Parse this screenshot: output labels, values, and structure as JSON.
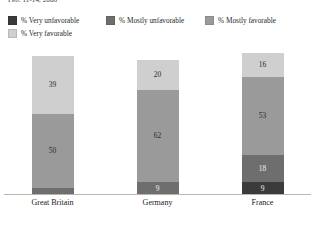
{
  "header": {
    "survey_date": "Feb. 11-14, 2008"
  },
  "legend": {
    "rows": [
      [
        {
          "label": "% Very unfavorable",
          "color": "#3b3b3b",
          "key": "very-unfavorable"
        },
        {
          "label": "% Mostly unfavorable",
          "color": "#6e6e6e",
          "key": "mostly-unfavorable"
        },
        {
          "label": "% Mostly favorable",
          "color": "#9a9a9a",
          "key": "mostly-favorable"
        }
      ],
      [
        {
          "label": "% Very favorable",
          "color": "#cfcfcf",
          "key": "very-favorable"
        }
      ]
    ]
  },
  "chart_data": {
    "type": "bar",
    "subtype": "stacked-bar",
    "title": "",
    "subtitle": "Feb. 11-14, 2008",
    "xlabel": "",
    "ylabel": "",
    "ylim": [
      0,
      100
    ],
    "grid": false,
    "legend_position": "top",
    "categories": [
      "Great Britain",
      "Germany",
      "France"
    ],
    "series": [
      {
        "name": "% Very unfavorable",
        "color": "#3b3b3b",
        "values": [
          0,
          0,
          9
        ],
        "labels": [
          "",
          "",
          "9"
        ]
      },
      {
        "name": "% Mostly unfavorable",
        "color": "#6e6e6e",
        "values": [
          5,
          9,
          18
        ],
        "labels": [
          "",
          "9",
          "18"
        ]
      },
      {
        "name": "% Mostly favorable",
        "color": "#9a9a9a",
        "values": [
          50,
          62,
          53
        ],
        "labels": [
          "50",
          "62",
          "53"
        ]
      },
      {
        "name": "% Very favorable",
        "color": "#cfcfcf",
        "values": [
          39,
          20,
          16
        ],
        "labels": [
          "39",
          "20",
          "16"
        ]
      }
    ]
  },
  "bars": [
    {
      "category": "Great Britain",
      "segments": [
        {
          "key": "very-favorable",
          "value": 39,
          "label": "39",
          "color": "#cfcfcf",
          "tone": "light"
        },
        {
          "key": "mostly-favorable",
          "value": 50,
          "label": "50",
          "color": "#9a9a9a",
          "tone": "mid"
        },
        {
          "key": "mostly-unfavorable",
          "value": 5,
          "label": "",
          "color": "#6e6e6e",
          "tone": "middark"
        }
      ]
    },
    {
      "category": "Germany",
      "segments": [
        {
          "key": "very-favorable",
          "value": 20,
          "label": "20",
          "color": "#cfcfcf",
          "tone": "light"
        },
        {
          "key": "mostly-favorable",
          "value": 62,
          "label": "62",
          "color": "#9a9a9a",
          "tone": "mid"
        },
        {
          "key": "mostly-unfavorable",
          "value": 9,
          "label": "9",
          "color": "#6e6e6e",
          "tone": "middark"
        }
      ]
    },
    {
      "category": "France",
      "segments": [
        {
          "key": "very-favorable",
          "value": 16,
          "label": "16",
          "color": "#cfcfcf",
          "tone": "light"
        },
        {
          "key": "mostly-favorable",
          "value": 53,
          "label": "53",
          "color": "#9a9a9a",
          "tone": "mid"
        },
        {
          "key": "mostly-unfavorable",
          "value": 18,
          "label": "18",
          "color": "#6e6e6e",
          "tone": "middark"
        },
        {
          "key": "very-unfavorable",
          "value": 9,
          "label": "9",
          "color": "#3b3b3b",
          "tone": "dark"
        }
      ]
    }
  ],
  "axis": {
    "labels": [
      "Great Britain",
      "Germany",
      "France"
    ],
    "line_color": "#b9b4ae"
  }
}
